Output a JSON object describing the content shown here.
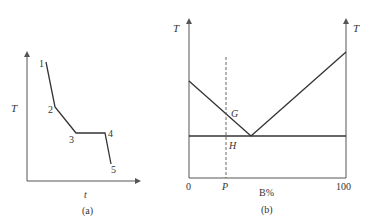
{
  "colors": {
    "background": "#ffffff",
    "line": "#333333",
    "axis": "#555555"
  },
  "panel_a": {
    "caption": "(a)",
    "y_axis_label": "T",
    "x_axis_label": "t",
    "points": [
      {
        "label": "1",
        "x": 46,
        "y": 62
      },
      {
        "label": "2",
        "x": 55,
        "y": 107
      },
      {
        "label": "3",
        "x": 76,
        "y": 133
      },
      {
        "label": "4",
        "x": 105,
        "y": 133
      },
      {
        "label": "5",
        "x": 111,
        "y": 164
      }
    ]
  },
  "panel_b": {
    "caption": "(b)",
    "left_axis_label": "T",
    "right_axis_label": "T",
    "x_axis_label": "B%",
    "x_tick_left": "0",
    "x_tick_right": "100",
    "composition_label": "P",
    "point_G": "G",
    "point_H": "H"
  }
}
